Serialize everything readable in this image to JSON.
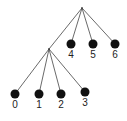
{
  "diagram": {
    "type": "tree",
    "root": {
      "id": "root",
      "children": [
        {
          "id": "internal",
          "children": [
            {
              "id": "leaf-0",
              "label": "0"
            },
            {
              "id": "leaf-1",
              "label": "1"
            },
            {
              "id": "leaf-2",
              "label": "2"
            },
            {
              "id": "leaf-3",
              "label": "3"
            }
          ]
        },
        {
          "id": "leaf-4",
          "label": "4"
        },
        {
          "id": "leaf-5",
          "label": "5"
        },
        {
          "id": "leaf-6",
          "label": "6"
        }
      ]
    },
    "colors": {
      "node": "#111111",
      "edge": "#444444",
      "label": "#222222"
    }
  }
}
